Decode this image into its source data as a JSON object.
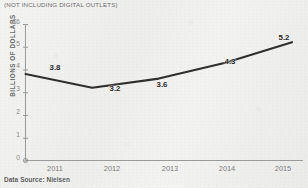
{
  "subtitle": "(NOT INCLUDING DIGITAL OUTLETS)",
  "source": "Data Source: Nielsen",
  "axis": {
    "y_label": "BILLIONS OF DOLLARS",
    "y_top_label": "$6",
    "y_ticks": [
      "$6",
      "5",
      "4",
      "3",
      "2",
      "1",
      "0"
    ],
    "x_ticks": [
      "2011",
      "2012",
      "2013",
      "2014",
      "2015"
    ]
  },
  "colors": {
    "background": "#f1f1f0",
    "line": "#2f2f2f",
    "axis": "#9a9a9a",
    "label_text": "#2b2b2b",
    "tick_text": "#7d7d7d",
    "muted_text": "#6e6e6e"
  },
  "chart_data": {
    "type": "line",
    "title": "",
    "subtitle": "(NOT INCLUDING DIGITAL OUTLETS)",
    "xlabel": "",
    "ylabel": "BILLIONS OF DOLLARS",
    "categories": [
      "2011",
      "2012",
      "2013",
      "2014",
      "2015"
    ],
    "x": [
      2011,
      2012,
      2013,
      2014,
      2015
    ],
    "values": [
      3.8,
      3.2,
      3.6,
      4.3,
      5.2
    ],
    "data_labels": [
      "3.8",
      "3.2",
      "3.6",
      "4.3",
      "5.2"
    ],
    "ylim": [
      0,
      6
    ],
    "ytick_values": [
      0,
      1,
      2,
      3,
      4,
      5,
      6
    ],
    "ytick_labels": [
      "0",
      "1",
      "2",
      "3",
      "4",
      "5",
      "$6"
    ],
    "y_axis_prefix": "$",
    "grid": false,
    "legend": false,
    "legend_position": "none",
    "annotations": [
      "Data Source: Nielsen"
    ],
    "series": [
      {
        "name": "Revenue",
        "values": [
          3.8,
          3.2,
          3.6,
          4.3,
          5.2
        ]
      }
    ]
  }
}
